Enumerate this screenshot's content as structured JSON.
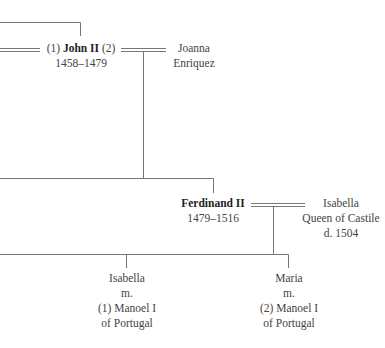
{
  "diagram": {
    "type": "family-tree",
    "line_color": "#777777",
    "persons": {
      "john": {
        "prefix": "(1)",
        "name": "John II",
        "suffix": "(2)",
        "dates": "1458–1479"
      },
      "joanna": {
        "line1": "Joanna",
        "line2": "Enriquez"
      },
      "ferdinand": {
        "name": "Ferdinand II",
        "dates": "1479–1516"
      },
      "isabella_castile": {
        "line1": "Isabella",
        "line2": "Queen of Castile",
        "line3": "d. 1504"
      },
      "isabella_child": {
        "line1": "Isabella",
        "line2": "m.",
        "line3": "(1) Manoel I",
        "line4": "of Portugal"
      },
      "maria_child": {
        "line1": "Maria",
        "line2": "m.",
        "line3": "(2) Manoel I",
        "line4": "of Portugal"
      }
    },
    "relations": [
      {
        "type": "marriage",
        "a": "john",
        "b": "joanna",
        "order": 2
      },
      {
        "type": "marriage",
        "a": "john",
        "b": "(offscreen)",
        "order": 1
      },
      {
        "type": "child",
        "parents": [
          "john",
          "joanna"
        ],
        "child": "ferdinand"
      },
      {
        "type": "marriage",
        "a": "ferdinand",
        "b": "isabella_castile"
      },
      {
        "type": "child",
        "parents": [
          "ferdinand",
          "isabella_castile"
        ],
        "child": "isabella_child"
      },
      {
        "type": "child",
        "parents": [
          "ferdinand",
          "isabella_castile"
        ],
        "child": "maria_child"
      }
    ]
  }
}
